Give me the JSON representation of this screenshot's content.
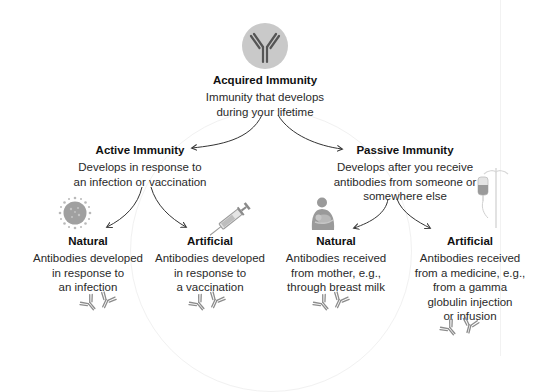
{
  "root": {
    "title": "Acquired Immunity",
    "description_lines": [
      "Immunity that develops",
      "during your lifetime"
    ],
    "icon": "antibody-icon"
  },
  "branches": {
    "active": {
      "title": "Active Immunity",
      "description_lines": [
        "Develops in response to",
        "an infection or vaccination"
      ],
      "children": {
        "natural": {
          "title": "Natural",
          "description_lines": [
            "Antibodies developed",
            "in response to",
            "an infection"
          ],
          "icon": "virus-icon"
        },
        "artificial": {
          "title": "Artificial",
          "description_lines": [
            "Antibodies developed",
            "in response to",
            "a vaccination"
          ],
          "icon": "syringe-icon"
        }
      }
    },
    "passive": {
      "title": "Passive Immunity",
      "description_lines": [
        "Develops after you receive",
        "antibodies from someone or",
        "somewhere else"
      ],
      "children": {
        "natural": {
          "title": "Natural",
          "description_lines": [
            "Antibodies received",
            "from mother, e.g.,",
            "through breast milk"
          ],
          "icon": "breastfeeding-mother-icon"
        },
        "artificial": {
          "title": "Artificial",
          "description_lines": [
            "Antibodies received",
            "from a medicine, e.g.,",
            "from a gamma",
            "globulin injection",
            "or infusion"
          ],
          "icon": "iv-drip-icon"
        }
      }
    }
  },
  "colors": {
    "text": "#1a1a1a",
    "icon_gray": "#8a8a8a",
    "icon_circle": "#c9c9c9",
    "arrow": "#333333",
    "background": "#ffffff"
  }
}
